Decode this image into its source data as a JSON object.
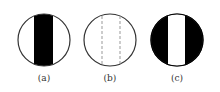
{
  "figure": {
    "panels": [
      {
        "label": "(a)",
        "description": "circle with black vertical band in center"
      },
      {
        "label": "(b)",
        "description": "circle with two dashed vertical lines"
      },
      {
        "label": "(c)",
        "description": "black circle with white vertical band in center"
      }
    ]
  },
  "colors": {
    "stroke": "#333333",
    "fill": "#000000",
    "dash": "#999999"
  }
}
